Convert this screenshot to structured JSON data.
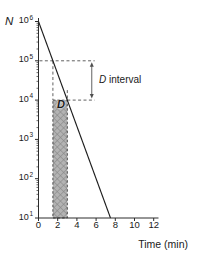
{
  "plot": {
    "y_axis_label": "N",
    "x_axis_title": "Time (min)",
    "d_region_label": "D",
    "d_interval_label_d": "D",
    "d_interval_label_rest": " interval",
    "y_ticks": [
      {
        "base": "10",
        "exp": "6"
      },
      {
        "base": "10",
        "exp": "5"
      },
      {
        "base": "10",
        "exp": "4"
      },
      {
        "base": "10",
        "exp": "3"
      },
      {
        "base": "10",
        "exp": "2"
      },
      {
        "base": "10",
        "exp": "1"
      }
    ],
    "x_ticks": [
      "0",
      "2",
      "4",
      "6",
      "8",
      "10",
      "12"
    ],
    "colors": {
      "text": "#1a1a1a",
      "axis": "#2c2c2c",
      "line": "#1c1c1c",
      "dash": "#4f4f4f",
      "rect_fill": "#b3b3b3",
      "rect_hatch": "#858585",
      "rect_border": "#4a4a4a"
    }
  },
  "chart_data": {
    "type": "line",
    "title": "",
    "xlabel": "Time (min)",
    "ylabel": "N",
    "x_range": [
      0,
      12
    ],
    "y_log_range": [
      1,
      6
    ],
    "grid": false,
    "series": [
      {
        "name": "survivor-curve",
        "points": [
          [
            0,
            1000000
          ],
          [
            7.5,
            10
          ]
        ]
      }
    ],
    "guides": {
      "dashed_h": [
        {
          "N": 100000,
          "t_from": 0.1,
          "t_to": 5.85
        },
        {
          "N": 10000,
          "t_from": 3.0,
          "t_to": 5.85
        }
      ],
      "dashed_v": [
        {
          "t": 1.5,
          "N_from": 100000,
          "N_to": 10000
        },
        {
          "t": 3.0,
          "N_from": 18000,
          "N_to": 10000
        }
      ],
      "interval_arrow": {
        "t": 5.55,
        "N_from": 100000,
        "N_to": 10000,
        "label": "D interval"
      },
      "d_rect": {
        "t_from": 1.5,
        "t_to": 3.0,
        "N_from": 10,
        "N_to": 10000,
        "label": "D",
        "meaning": "decimal reduction time D = 1.5 min (one log10 reduction)"
      }
    }
  }
}
